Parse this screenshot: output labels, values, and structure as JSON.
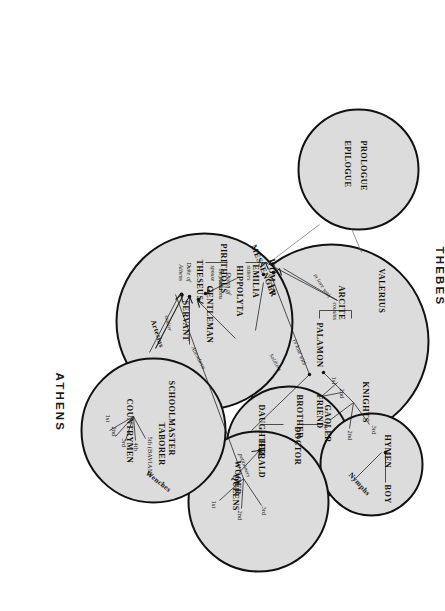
{
  "diagram": {
    "groups": [
      {
        "id": "thebes",
        "label": "THEBES"
      },
      {
        "id": "athens",
        "label": "ATHENS"
      }
    ],
    "colors": {
      "circle_fill": "#dcdcdc",
      "circle_stroke": "#111111",
      "text": "#111111",
      "background": "#ffffff"
    }
  },
  "circles": [
    {
      "id": "prologue",
      "name": "prologue-epilogue-circle"
    },
    {
      "id": "thebes",
      "name": "thebes-circle"
    },
    {
      "id": "court",
      "name": "athens-court-circle"
    },
    {
      "id": "prison",
      "name": "gaoler-circle"
    },
    {
      "id": "hymen",
      "name": "hymen-circle"
    },
    {
      "id": "queens",
      "name": "queens-circle"
    },
    {
      "id": "country",
      "name": "countrymen-circle"
    }
  ],
  "prologue": {
    "line1": "PROLOGUE",
    "line2": "EPILOGUE"
  },
  "thebes": {
    "valerius": "VALERIUS",
    "arcite": "ARCITE",
    "palamon": "PALAMON",
    "knights": "KNIGHTS",
    "knight_ordinals": [
      "1st",
      "2nd",
      "3rd"
    ],
    "rel_cousins": "cousins",
    "rel_in_love_with_arcite": "in love with",
    "rel_in_love_with_palamon": "in love with"
  },
  "court": {
    "messenger": "MESSENGER",
    "pirithous": "PIRITHOUS",
    "hippolyta": "HIPPOLYTA",
    "hippolyta_role": "Queen of\nthe Amazons",
    "hippolyta_role_l1": "Queen of",
    "hippolyta_role_l2": "the Amazons",
    "emilia": "EMILIA",
    "theseus": "THESEUS",
    "theseus_role_l1": "Duke of",
    "theseus_role_l2": "Athens",
    "woman": "WOMAN",
    "gentleman": "GENTLEMAN",
    "servant": "SERVANT",
    "artesius": "Artesius",
    "rel_friend": "friend",
    "rel_spouse": "spouse",
    "rel_sisters": "sisters",
    "rel_soldier": "soldier",
    "rel_attendants": "Attendants",
    "rel_soldiers": "Soldiers"
  },
  "prison": {
    "friend": "FRIEND",
    "friend_ordinals": [
      "1st",
      "2nd"
    ],
    "brother": "BROTHER",
    "gaoler": "GAOLER",
    "daughter": "DAUGHTER",
    "doctor": "DOCTOR",
    "wooer": "WOOER"
  },
  "hymen": {
    "hymen": "HYMEN",
    "boy": "BOY",
    "nymphs": "Nymphs"
  },
  "queens": {
    "herald": "HERALD",
    "queens": "QUEENS",
    "queen_ordinals": [
      "1st",
      "2nd",
      "3rd"
    ],
    "rel_petitioners": "petitioners"
  },
  "country": {
    "schoolmaster": "SCHOOLMASTER",
    "taborer": "TABORER",
    "countrymen": "COUNTRYMEN",
    "countrymen_ordinals": [
      "1st",
      "2nd",
      "3rd",
      "4th",
      "5th (BAVIAN)"
    ],
    "wenches": "Wenches"
  }
}
